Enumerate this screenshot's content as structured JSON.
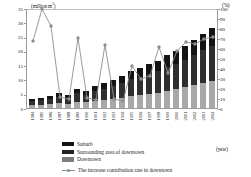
{
  "chart_data": {
    "type": "bar",
    "title": "",
    "xlabel": "(year)",
    "ylabel": "(million m3)",
    "y2label": "(%)",
    "ylim": [
      0,
      35
    ],
    "y2lim": [
      0,
      100
    ],
    "grid": false,
    "legend_position": "bottom",
    "categories": [
      "1984",
      "1985",
      "1986",
      "1987",
      "1988",
      "1989",
      "1990",
      "1991",
      "1992",
      "1993",
      "1994",
      "1995",
      "1996",
      "1997",
      "1998",
      "1999",
      "2000",
      "2001",
      "2002",
      "2003",
      "2004"
    ],
    "yticks": [
      "35",
      "30",
      "25",
      "20",
      "15",
      "10",
      "5",
      "0"
    ],
    "y2ticks": [
      "100",
      "90",
      "80",
      "70",
      "60",
      "50",
      "40",
      "30",
      "20",
      "10",
      "0"
    ],
    "series": [
      {
        "name": "Downtown",
        "color": "#a8a8a8",
        "axis": "left",
        "values": [
          1.0,
          1.1,
          1.3,
          1.6,
          1.4,
          2.2,
          2.0,
          2.6,
          2.8,
          3.2,
          3.6,
          4.2,
          4.6,
          5.0,
          5.4,
          6.0,
          6.6,
          7.2,
          8.0,
          8.8,
          9.6
        ]
      },
      {
        "name": "Surrounding area of downtown",
        "color": "#2f2f2f",
        "axis": "left",
        "values": [
          1.5,
          1.6,
          1.8,
          2.4,
          2.0,
          3.0,
          2.6,
          3.4,
          3.8,
          4.4,
          5.0,
          5.8,
          6.2,
          6.8,
          7.4,
          8.2,
          8.8,
          9.6,
          10.4,
          11.4,
          12.2
        ]
      },
      {
        "name": "Suburb",
        "color": "#141414",
        "axis": "left",
        "values": [
          0.8,
          0.9,
          1.0,
          1.2,
          1.0,
          1.6,
          1.4,
          1.8,
          2.0,
          2.2,
          2.6,
          3.0,
          3.2,
          3.6,
          3.8,
          4.2,
          4.6,
          5.0,
          5.4,
          5.8,
          6.2
        ]
      }
    ],
    "line_series": {
      "name": "The increase contribution rate in downtown",
      "color": "#8f8f8f",
      "axis": "right",
      "values": [
        68,
        100,
        83,
        12,
        10,
        71,
        11,
        9,
        64,
        10,
        8,
        43,
        30,
        33,
        62,
        36,
        58,
        67,
        65,
        70,
        72
      ]
    }
  },
  "legend": {
    "items": [
      {
        "label": "Suburb",
        "swatch": "sw-suburb"
      },
      {
        "label": "Surrounding area of downtown",
        "swatch": "sw-surrounding"
      },
      {
        "label": "Downtown",
        "swatch": "sw-downtown"
      }
    ],
    "line_label": "The increase contribution rate in downtown"
  }
}
